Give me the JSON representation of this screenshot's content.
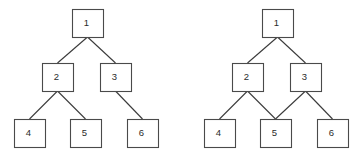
{
  "figure": {
    "background_color": "#ffffff",
    "width": 363,
    "height": 159,
    "stroke_color": "#4a4a4a",
    "edge_color": "#3a3a3a",
    "label_color": "#2b2b2b",
    "node_fill": "#ffffff",
    "node_width": 31,
    "node_height": 28
  },
  "chart_data": {
    "type": "diagram",
    "subtype": "node-link-graph",
    "title": "",
    "xlabel": "",
    "ylabel": "",
    "grid": false,
    "legend": "none",
    "panels": [
      {
        "name": "left-graph",
        "label": "",
        "kind": "tree",
        "nodes": [
          {
            "id": "L1",
            "label": "1",
            "x": 72,
            "y": 9,
            "level": 0
          },
          {
            "id": "L2",
            "label": "2",
            "x": 42,
            "y": 63,
            "level": 1
          },
          {
            "id": "L3",
            "label": "3",
            "x": 100,
            "y": 63,
            "level": 1
          },
          {
            "id": "L4",
            "label": "4",
            "x": 14,
            "y": 119,
            "level": 2
          },
          {
            "id": "L5",
            "label": "5",
            "x": 70,
            "y": 119,
            "level": 2
          },
          {
            "id": "L6",
            "label": "6",
            "x": 127,
            "y": 119,
            "level": 2
          }
        ],
        "edges": [
          {
            "from": "L1",
            "to": "L2"
          },
          {
            "from": "L1",
            "to": "L3"
          },
          {
            "from": "L2",
            "to": "L4"
          },
          {
            "from": "L2",
            "to": "L5"
          },
          {
            "from": "L3",
            "to": "L6"
          }
        ]
      },
      {
        "name": "right-graph",
        "label": "",
        "kind": "dag",
        "nodes": [
          {
            "id": "R1",
            "label": "1",
            "x": 262,
            "y": 9,
            "level": 0
          },
          {
            "id": "R2",
            "label": "2",
            "x": 232,
            "y": 63,
            "level": 1
          },
          {
            "id": "R3",
            "label": "3",
            "x": 290,
            "y": 63,
            "level": 1
          },
          {
            "id": "R4",
            "label": "4",
            "x": 204,
            "y": 119,
            "level": 2
          },
          {
            "id": "R5",
            "label": "5",
            "x": 260,
            "y": 119,
            "level": 2
          },
          {
            "id": "R6",
            "label": "6",
            "x": 317,
            "y": 119,
            "level": 2
          }
        ],
        "edges": [
          {
            "from": "R1",
            "to": "R2"
          },
          {
            "from": "R1",
            "to": "R3"
          },
          {
            "from": "R2",
            "to": "R4"
          },
          {
            "from": "R2",
            "to": "R5"
          },
          {
            "from": "R3",
            "to": "R5"
          },
          {
            "from": "R3",
            "to": "R6"
          }
        ]
      }
    ]
  }
}
